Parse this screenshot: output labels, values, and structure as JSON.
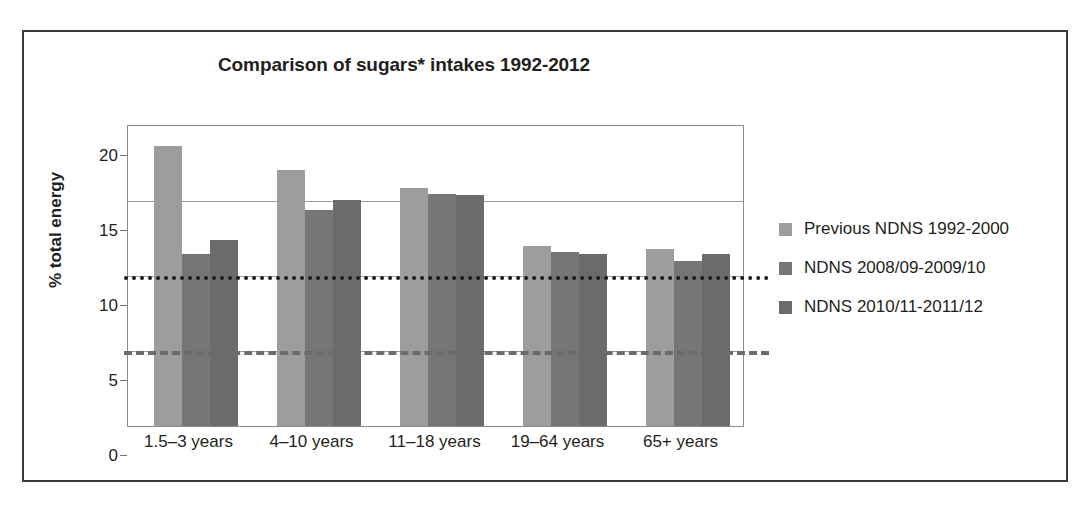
{
  "figure": {
    "title": "Comparison of sugars* intakes 1992-2012"
  },
  "chart_data": {
    "type": "bar",
    "title": "Comparison of sugars* intakes 1992-2012",
    "xlabel": "",
    "ylabel": "% total energy",
    "ylim": [
      0,
      20
    ],
    "yticks": [
      0,
      5,
      10,
      15,
      20
    ],
    "grid": true,
    "legend_position": "right",
    "categories": [
      "1.5–3 years",
      "4–10 years",
      "11–18 years",
      "19–64 years",
      "65+ years"
    ],
    "series": [
      {
        "name": "Previous NDNS 1992-2000",
        "color": "#9d9d9d",
        "values": [
          18.7,
          17.1,
          15.9,
          12.0,
          11.8
        ]
      },
      {
        "name": "NDNS 2008/09-2009/10",
        "color": "#767676",
        "values": [
          11.5,
          14.4,
          15.5,
          11.6,
          11.0
        ]
      },
      {
        "name": "NDNS 2010/11-2011/12",
        "color": "#6b6b6b",
        "values": [
          12.4,
          15.1,
          15.4,
          11.5,
          11.5
        ]
      }
    ],
    "reference_lines": [
      {
        "name": "10% recommendation",
        "value": 10,
        "style": "dotted",
        "color": "#1b1b1b"
      },
      {
        "name": "5% recommendation",
        "value": 5,
        "style": "dashed",
        "color": "#6b6b6b"
      }
    ]
  }
}
